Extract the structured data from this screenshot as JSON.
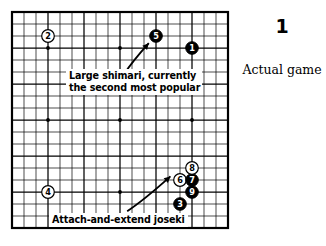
{
  "figure": {
    "number": "1",
    "caption": "Actual game"
  },
  "annotations": {
    "shimari": "Large shimari, currently\nthe second most popular",
    "shimari_line1": "Large shimari, currently",
    "shimari_line2": "the second most popular",
    "joseki": "Attach-and-extend joseki"
  },
  "board": {
    "size": 19,
    "grid_color": "#000000",
    "background_color": "#ffffff",
    "black_stone_color": "#000000",
    "white_stone_color": "#ffffff",
    "star_points": [
      {
        "col": 3,
        "row": 3
      },
      {
        "col": 9,
        "row": 3
      },
      {
        "col": 15,
        "row": 3
      },
      {
        "col": 3,
        "row": 9
      },
      {
        "col": 9,
        "row": 9
      },
      {
        "col": 15,
        "row": 9
      },
      {
        "col": 3,
        "row": 15
      },
      {
        "col": 9,
        "row": 15
      },
      {
        "col": 15,
        "row": 15
      }
    ],
    "moves": [
      {
        "label": "1",
        "color": "black",
        "col": 15,
        "row": 3
      },
      {
        "label": "2",
        "color": "white",
        "col": 3,
        "row": 2
      },
      {
        "label": "3",
        "color": "black",
        "col": 14,
        "row": 16
      },
      {
        "label": "4",
        "color": "white",
        "col": 3,
        "row": 15
      },
      {
        "label": "5",
        "color": "black",
        "col": 12,
        "row": 2
      },
      {
        "label": "6",
        "color": "white",
        "col": 14,
        "row": 14
      },
      {
        "label": "7",
        "color": "black",
        "col": 15,
        "row": 14
      },
      {
        "label": "8",
        "color": "white",
        "col": 15,
        "row": 13
      },
      {
        "label": "9",
        "color": "black",
        "col": 15,
        "row": 15
      }
    ],
    "arrows": [
      {
        "name": "arrow-to-shimari",
        "from_col": 9.4,
        "from_row": 5.1,
        "to_col": 11.4,
        "to_row": 2.6
      },
      {
        "name": "arrow-to-joseki",
        "from_col": 9.6,
        "from_row": 16.6,
        "to_col": 13.2,
        "to_row": 13.7
      }
    ]
  }
}
